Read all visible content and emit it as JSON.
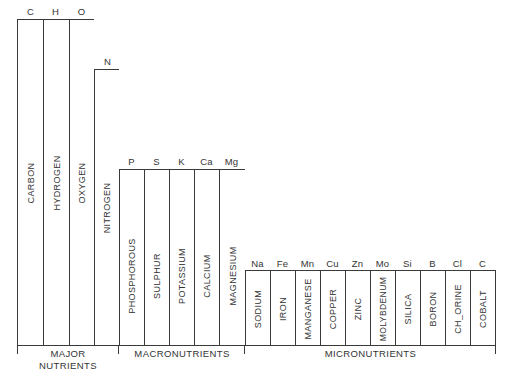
{
  "diagram": {
    "type": "nutrient-requirement-step-chart",
    "groups": [
      {
        "label": "MAJOR NUTRIENTS",
        "label_lines": [
          "MAJOR",
          "NUTRIENTS"
        ],
        "elements": [
          {
            "symbol": "C",
            "name": "CARBON"
          },
          {
            "symbol": "H",
            "name": "HYDROGEN"
          },
          {
            "symbol": "O",
            "name": "OXYGEN"
          },
          {
            "symbol": "N",
            "name": "NITROGEN"
          }
        ]
      },
      {
        "label": "MACRONUTRIENTS",
        "label_lines": [
          "MACRONUTRIENTS"
        ],
        "elements": [
          {
            "symbol": "P",
            "name": "PHOSPHOROUS"
          },
          {
            "symbol": "S",
            "name": "SULPHUR"
          },
          {
            "symbol": "K",
            "name": "POTASSIUM"
          },
          {
            "symbol": "Ca",
            "name": "CALCIUM"
          },
          {
            "symbol": "Mg",
            "name": "MAGNESIUM"
          }
        ]
      },
      {
        "label": "MICRONUTRIENTS",
        "label_lines": [
          "MICRONUTRIENTS"
        ],
        "elements": [
          {
            "symbol": "Na",
            "name": "SODIUM"
          },
          {
            "symbol": "Fe",
            "name": "IRON"
          },
          {
            "symbol": "Mn",
            "name": "MANGANESE"
          },
          {
            "symbol": "Cu",
            "name": "COPPER"
          },
          {
            "symbol": "Zn",
            "name": "ZINC"
          },
          {
            "symbol": "Mo",
            "name": "MOLYBDENUM"
          },
          {
            "symbol": "Si",
            "name": "SILICA"
          },
          {
            "symbol": "B",
            "name": "BORON"
          },
          {
            "symbol": "Cl",
            "name": "CH_ORINE"
          },
          {
            "symbol": "C",
            "name": "COBALT"
          }
        ]
      }
    ]
  },
  "colors": {
    "line": "#3a3a3a",
    "text": "#333333",
    "background": "#ffffff"
  }
}
